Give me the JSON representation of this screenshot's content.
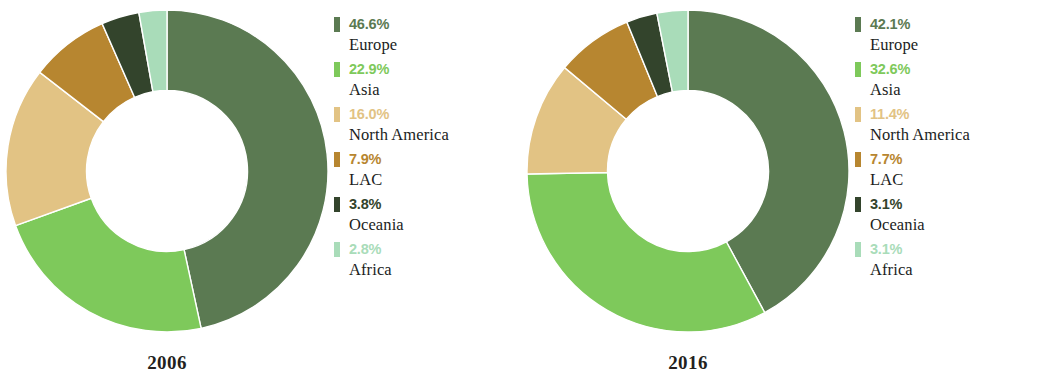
{
  "chart_data": [
    {
      "type": "pie",
      "title": "2006",
      "subtitle": "",
      "variant": "donut",
      "hole_ratio": 0.5,
      "start_angle": 0,
      "direction": "clockwise",
      "xlabel": "",
      "ylabel": "",
      "categories": [
        "Europe",
        "Asia",
        "North America",
        "LAC",
        "Oceania",
        "Africa"
      ],
      "values": [
        46.6,
        22.9,
        16.0,
        7.9,
        3.8,
        2.8
      ],
      "value_labels": [
        "46.6%",
        "22.9%",
        "16.0%",
        "7.9%",
        "3.8%",
        "2.8%"
      ],
      "colors": [
        "#5b7a52",
        "#7ec95b",
        "#e2c384",
        "#b78630",
        "#33442c",
        "#a9dcb9"
      ],
      "legend_position": "right",
      "grid": false
    },
    {
      "type": "pie",
      "title": "2016",
      "subtitle": "",
      "variant": "donut",
      "hole_ratio": 0.5,
      "start_angle": 0,
      "direction": "clockwise",
      "xlabel": "",
      "ylabel": "",
      "categories": [
        "Europe",
        "Asia",
        "North America",
        "LAC",
        "Oceania",
        "Africa"
      ],
      "values": [
        42.1,
        32.6,
        11.4,
        7.7,
        3.1,
        3.1
      ],
      "value_labels": [
        "42.1%",
        "32.6%",
        "11.4%",
        "7.7%",
        "3.1%",
        "3.1%"
      ],
      "colors": [
        "#5b7a52",
        "#7ec95b",
        "#e2c384",
        "#b78630",
        "#33442c",
        "#a9dcb9"
      ],
      "legend_position": "right",
      "grid": false
    }
  ],
  "panels": [
    {
      "year": "2006",
      "legend": [
        {
          "value": "46.6%",
          "name": "Europe",
          "color": "#5b7a52"
        },
        {
          "value": "22.9%",
          "name": "Asia",
          "color": "#7ec95b"
        },
        {
          "value": "16.0%",
          "name": "North America",
          "color": "#e2c384"
        },
        {
          "value": "7.9%",
          "name": "LAC",
          "color": "#b78630"
        },
        {
          "value": "3.8%",
          "name": "Oceania",
          "color": "#33442c"
        },
        {
          "value": "2.8%",
          "name": "Africa",
          "color": "#a9dcb9"
        }
      ]
    },
    {
      "year": "2016",
      "legend": [
        {
          "value": "42.1%",
          "name": "Europe",
          "color": "#5b7a52"
        },
        {
          "value": "32.6%",
          "name": "Asia",
          "color": "#7ec95b"
        },
        {
          "value": "11.4%",
          "name": "North America",
          "color": "#e2c384"
        },
        {
          "value": "7.7%",
          "name": "LAC",
          "color": "#b78630"
        },
        {
          "value": "3.1%",
          "name": "Oceania",
          "color": "#33442c"
        },
        {
          "value": "3.1%",
          "name": "Africa",
          "color": "#a9dcb9"
        }
      ]
    }
  ]
}
